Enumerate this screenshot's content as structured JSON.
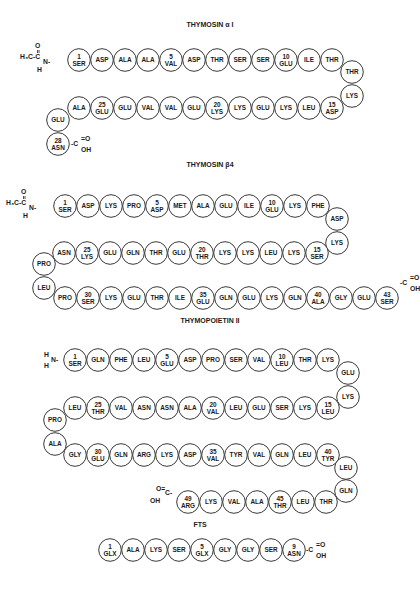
{
  "peptides": [
    {
      "id": "thymosin-alpha1",
      "title": "THYMOSIN α I",
      "title_pos": [
        210,
        27
      ],
      "n_term": {
        "label": "H3C-C(=O)-N(H)-",
        "type": "acetyl",
        "pos": [
          40,
          60
        ]
      },
      "c_term": {
        "label": "-C(=O)OH",
        "pos": [
          69,
          144
        ]
      },
      "residues": [
        {
          "n": 1,
          "name": "SER",
          "x": 79,
          "y": 60,
          "num": "1"
        },
        {
          "n": 2,
          "name": "ASP",
          "x": 102,
          "y": 60
        },
        {
          "n": 3,
          "name": "ALA",
          "x": 125,
          "y": 60
        },
        {
          "n": 4,
          "name": "ALA",
          "x": 148,
          "y": 60
        },
        {
          "n": 5,
          "name": "VAL",
          "x": 171,
          "y": 60,
          "num": "5"
        },
        {
          "n": 6,
          "name": "ASP",
          "x": 194,
          "y": 60
        },
        {
          "n": 7,
          "name": "THR",
          "x": 217,
          "y": 60
        },
        {
          "n": 8,
          "name": "SER",
          "x": 240,
          "y": 60
        },
        {
          "n": 9,
          "name": "SER",
          "x": 263,
          "y": 60
        },
        {
          "n": 10,
          "name": "GLU",
          "x": 286,
          "y": 60,
          "num": "10"
        },
        {
          "n": 11,
          "name": "ILE",
          "x": 309,
          "y": 60
        },
        {
          "n": 12,
          "name": "THR",
          "x": 332,
          "y": 60
        },
        {
          "n": 13,
          "name": "THR",
          "x": 352,
          "y": 72
        },
        {
          "n": 14,
          "name": "LYS",
          "x": 352,
          "y": 96
        },
        {
          "n": 15,
          "name": "ASP",
          "x": 332,
          "y": 108,
          "num": "15"
        },
        {
          "n": 16,
          "name": "LEU",
          "x": 309,
          "y": 108
        },
        {
          "n": 17,
          "name": "LYS",
          "x": 286,
          "y": 108
        },
        {
          "n": 18,
          "name": "GLU",
          "x": 263,
          "y": 108
        },
        {
          "n": 19,
          "name": "LYS",
          "x": 240,
          "y": 108
        },
        {
          "n": 20,
          "name": "LYS",
          "x": 217,
          "y": 108,
          "num": "20"
        },
        {
          "n": 21,
          "name": "GLU",
          "x": 194,
          "y": 108
        },
        {
          "n": 22,
          "name": "VAL",
          "x": 171,
          "y": 108
        },
        {
          "n": 23,
          "name": "VAL",
          "x": 148,
          "y": 108
        },
        {
          "n": 24,
          "name": "GLU",
          "x": 125,
          "y": 108
        },
        {
          "n": 25,
          "name": "GLU",
          "x": 102,
          "y": 108,
          "num": "25"
        },
        {
          "n": 26,
          "name": "ALA",
          "x": 79,
          "y": 108
        },
        {
          "n": 27,
          "name": "GLU",
          "x": 58,
          "y": 120
        },
        {
          "n": 28,
          "name": "ASN",
          "x": 58,
          "y": 144,
          "num": "28"
        }
      ]
    },
    {
      "id": "thymosin-beta4",
      "title": "THYMOSIN β4",
      "title_pos": [
        210,
        167
      ],
      "n_term": {
        "label": "H3C-C(=O)-N(H)-",
        "type": "acetyl",
        "pos": [
          26,
          206
        ]
      },
      "c_term": {
        "label": "-C(=O)OH",
        "pos": [
          398,
          283
        ]
      },
      "residues": [
        {
          "n": 1,
          "name": "SER",
          "x": 65,
          "y": 206,
          "num": "1"
        },
        {
          "n": 2,
          "name": "ASP",
          "x": 88,
          "y": 206
        },
        {
          "n": 3,
          "name": "LYS",
          "x": 111,
          "y": 206
        },
        {
          "n": 4,
          "name": "PRO",
          "x": 134,
          "y": 206
        },
        {
          "n": 5,
          "name": "ASP",
          "x": 157,
          "y": 206,
          "num": "5"
        },
        {
          "n": 6,
          "name": "MET",
          "x": 180,
          "y": 206
        },
        {
          "n": 7,
          "name": "ALA",
          "x": 203,
          "y": 206
        },
        {
          "n": 8,
          "name": "GLU",
          "x": 226,
          "y": 206
        },
        {
          "n": 9,
          "name": "ILE",
          "x": 249,
          "y": 206
        },
        {
          "n": 10,
          "name": "GLU",
          "x": 272,
          "y": 206,
          "num": "10"
        },
        {
          "n": 11,
          "name": "LYS",
          "x": 295,
          "y": 206
        },
        {
          "n": 12,
          "name": "PHE",
          "x": 318,
          "y": 206
        },
        {
          "n": 13,
          "name": "ASP",
          "x": 337,
          "y": 219
        },
        {
          "n": 14,
          "name": "LYS",
          "x": 337,
          "y": 243
        },
        {
          "n": 15,
          "name": "SER",
          "x": 317,
          "y": 253,
          "num": "15"
        },
        {
          "n": 16,
          "name": "LYS",
          "x": 294,
          "y": 253
        },
        {
          "n": 17,
          "name": "LEU",
          "x": 271,
          "y": 253
        },
        {
          "n": 18,
          "name": "LYS",
          "x": 248,
          "y": 253
        },
        {
          "n": 19,
          "name": "LYS",
          "x": 225,
          "y": 253
        },
        {
          "n": 20,
          "name": "THR",
          "x": 202,
          "y": 253,
          "num": "20"
        },
        {
          "n": 21,
          "name": "GLU",
          "x": 179,
          "y": 253
        },
        {
          "n": 22,
          "name": "THR",
          "x": 156,
          "y": 253
        },
        {
          "n": 23,
          "name": "GLN",
          "x": 133,
          "y": 253
        },
        {
          "n": 24,
          "name": "GLU",
          "x": 110,
          "y": 253
        },
        {
          "n": 25,
          "name": "LYS",
          "x": 87,
          "y": 253,
          "num": "25"
        },
        {
          "n": 26,
          "name": "ASN",
          "x": 64,
          "y": 253
        },
        {
          "n": 27,
          "name": "PRO",
          "x": 44,
          "y": 264
        },
        {
          "n": 28,
          "name": "LEU",
          "x": 44,
          "y": 288
        },
        {
          "n": 29,
          "name": "PRO",
          "x": 65,
          "y": 298
        },
        {
          "n": 30,
          "name": "SER",
          "x": 88,
          "y": 298,
          "num": "30"
        },
        {
          "n": 31,
          "name": "LYS",
          "x": 111,
          "y": 298
        },
        {
          "n": 32,
          "name": "GLU",
          "x": 134,
          "y": 298
        },
        {
          "n": 33,
          "name": "THR",
          "x": 157,
          "y": 298
        },
        {
          "n": 34,
          "name": "ILE",
          "x": 180,
          "y": 298
        },
        {
          "n": 35,
          "name": "GLU",
          "x": 203,
          "y": 298,
          "num": "35"
        },
        {
          "n": 36,
          "name": "GLN",
          "x": 226,
          "y": 298
        },
        {
          "n": 37,
          "name": "GLU",
          "x": 249,
          "y": 298
        },
        {
          "n": 38,
          "name": "LYS",
          "x": 272,
          "y": 298
        },
        {
          "n": 39,
          "name": "GLN",
          "x": 295,
          "y": 298
        },
        {
          "n": 40,
          "name": "ALA",
          "x": 318,
          "y": 298,
          "num": "40"
        },
        {
          "n": 41,
          "name": "GLY",
          "x": 341,
          "y": 298
        },
        {
          "n": 42,
          "name": "GLU",
          "x": 364,
          "y": 298
        },
        {
          "n": 43,
          "name": "SER",
          "x": 387,
          "y": 298,
          "num": "43"
        }
      ]
    },
    {
      "id": "thymopoietin-II",
      "title": "THYMOPOIETIN II",
      "title_pos": [
        210,
        323
      ],
      "n_term": {
        "label": "H2N-",
        "type": "amine",
        "pos": [
          46,
          360
        ]
      },
      "c_term": {
        "label": "HO-C(=O)-",
        "pos": [
          160,
          493
        ]
      },
      "residues": [
        {
          "n": 1,
          "name": "SER",
          "x": 75,
          "y": 360,
          "num": "1"
        },
        {
          "n": 2,
          "name": "GLN",
          "x": 98,
          "y": 360
        },
        {
          "n": 3,
          "name": "PHE",
          "x": 121,
          "y": 360
        },
        {
          "n": 4,
          "name": "LEU",
          "x": 144,
          "y": 360
        },
        {
          "n": 5,
          "name": "GLU",
          "x": 167,
          "y": 360,
          "num": "5"
        },
        {
          "n": 6,
          "name": "ASP",
          "x": 190,
          "y": 360
        },
        {
          "n": 7,
          "name": "PRO",
          "x": 213,
          "y": 360
        },
        {
          "n": 8,
          "name": "SER",
          "x": 236,
          "y": 360
        },
        {
          "n": 9,
          "name": "VAL",
          "x": 259,
          "y": 360
        },
        {
          "n": 10,
          "name": "LEU",
          "x": 282,
          "y": 360,
          "num": "10"
        },
        {
          "n": 11,
          "name": "THR",
          "x": 305,
          "y": 360
        },
        {
          "n": 12,
          "name": "LYS",
          "x": 328,
          "y": 360
        },
        {
          "n": 13,
          "name": "GLU",
          "x": 348,
          "y": 373
        },
        {
          "n": 14,
          "name": "LYS",
          "x": 348,
          "y": 397
        },
        {
          "n": 15,
          "name": "LEU",
          "x": 328,
          "y": 408,
          "num": "15"
        },
        {
          "n": 16,
          "name": "LYS",
          "x": 305,
          "y": 408
        },
        {
          "n": 17,
          "name": "SER",
          "x": 282,
          "y": 408
        },
        {
          "n": 18,
          "name": "GLU",
          "x": 259,
          "y": 408
        },
        {
          "n": 19,
          "name": "LEU",
          "x": 236,
          "y": 408
        },
        {
          "n": 20,
          "name": "VAL",
          "x": 213,
          "y": 408,
          "num": "20"
        },
        {
          "n": 21,
          "name": "ALA",
          "x": 190,
          "y": 408
        },
        {
          "n": 22,
          "name": "ASN",
          "x": 167,
          "y": 408
        },
        {
          "n": 23,
          "name": "ASN",
          "x": 144,
          "y": 408
        },
        {
          "n": 24,
          "name": "VAL",
          "x": 121,
          "y": 408
        },
        {
          "n": 25,
          "name": "THR",
          "x": 98,
          "y": 408,
          "num": "25"
        },
        {
          "n": 26,
          "name": "LEU",
          "x": 75,
          "y": 408
        },
        {
          "n": 27,
          "name": "PRO",
          "x": 55,
          "y": 420
        },
        {
          "n": 28,
          "name": "ALA",
          "x": 55,
          "y": 444
        },
        {
          "n": 29,
          "name": "GLY",
          "x": 75,
          "y": 455
        },
        {
          "n": 30,
          "name": "GLU",
          "x": 98,
          "y": 455,
          "num": "30"
        },
        {
          "n": 31,
          "name": "GLN",
          "x": 121,
          "y": 455
        },
        {
          "n": 32,
          "name": "ARG",
          "x": 144,
          "y": 455
        },
        {
          "n": 33,
          "name": "LYS",
          "x": 167,
          "y": 455
        },
        {
          "n": 34,
          "name": "ASP",
          "x": 190,
          "y": 455
        },
        {
          "n": 35,
          "name": "VAL",
          "x": 213,
          "y": 455,
          "num": "35"
        },
        {
          "n": 36,
          "name": "TYR",
          "x": 236,
          "y": 455
        },
        {
          "n": 37,
          "name": "VAL",
          "x": 259,
          "y": 455
        },
        {
          "n": 38,
          "name": "GLN",
          "x": 282,
          "y": 455
        },
        {
          "n": 39,
          "name": "LEU",
          "x": 305,
          "y": 455
        },
        {
          "n": 40,
          "name": "TYR",
          "x": 328,
          "y": 455,
          "num": "40"
        },
        {
          "n": 41,
          "name": "LEU",
          "x": 346,
          "y": 468
        },
        {
          "n": 42,
          "name": "GLN",
          "x": 346,
          "y": 491
        },
        {
          "n": 43,
          "name": "THR",
          "x": 326,
          "y": 502
        },
        {
          "n": 44,
          "name": "LEU",
          "x": 303,
          "y": 502
        },
        {
          "n": 45,
          "name": "THR",
          "x": 280,
          "y": 502,
          "num": "45"
        },
        {
          "n": 46,
          "name": "ALA",
          "x": 257,
          "y": 502
        },
        {
          "n": 47,
          "name": "VAL",
          "x": 234,
          "y": 502
        },
        {
          "n": 48,
          "name": "LYS",
          "x": 211,
          "y": 502
        },
        {
          "n": 49,
          "name": "ARG",
          "x": 188,
          "y": 502,
          "num": "49"
        }
      ]
    },
    {
      "id": "fts",
      "title": "FTS",
      "title_pos": [
        200,
        527
      ],
      "n_term": null,
      "c_term": {
        "label": "-C(=O)OH",
        "pos": [
          304,
          550
        ]
      },
      "residues": [
        {
          "n": 1,
          "name": "GLX",
          "x": 110,
          "y": 550,
          "num": "1"
        },
        {
          "n": 2,
          "name": "ALA",
          "x": 133,
          "y": 550
        },
        {
          "n": 3,
          "name": "LYS",
          "x": 156,
          "y": 550
        },
        {
          "n": 4,
          "name": "SER",
          "x": 179,
          "y": 550
        },
        {
          "n": 5,
          "name": "GLX",
          "x": 202,
          "y": 550,
          "num": "5"
        },
        {
          "n": 6,
          "name": "GLY",
          "x": 225,
          "y": 550
        },
        {
          "n": 7,
          "name": "GLY",
          "x": 248,
          "y": 550
        },
        {
          "n": 8,
          "name": "SER",
          "x": 271,
          "y": 550
        },
        {
          "n": 9,
          "name": "ASN",
          "x": 294,
          "y": 550,
          "num": "9"
        }
      ]
    }
  ],
  "style": {
    "stroke": "#222222",
    "fill": "#ffffff",
    "text": "#1a1a1a",
    "radius": 11.3
  }
}
